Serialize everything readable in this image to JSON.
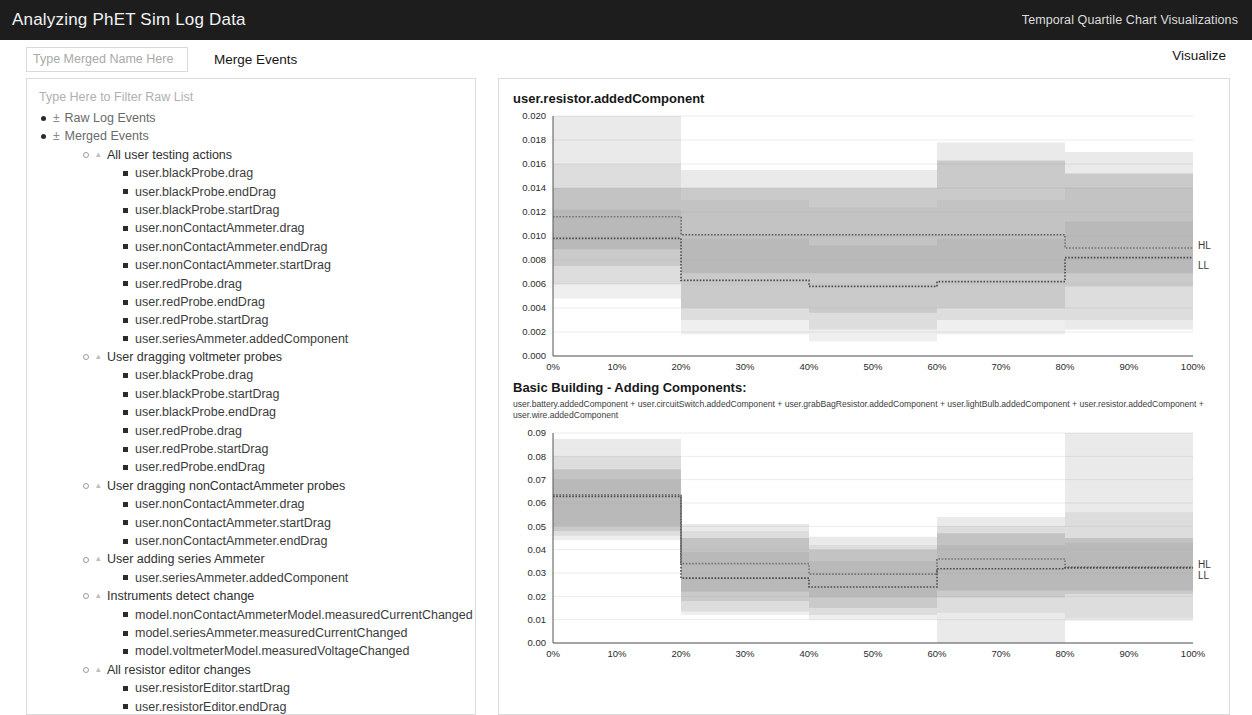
{
  "topbar": {
    "title": "Analyzing PhET Sim Log Data",
    "right_label": "Temporal Quartile Chart Visualizations"
  },
  "toolbar": {
    "merge_name_value": "",
    "merge_name_placeholder": "Type Merged Name Here",
    "merge_button": "Merge Events",
    "visualize_button": "Visualize"
  },
  "tree_panel": {
    "filter_value": "",
    "filter_placeholder": "Type Here to Filter Raw List",
    "toggle_symbol": "±",
    "nodes": [
      {
        "level": 0,
        "marker": "dot",
        "toggle": "±",
        "label": "Raw Log Events"
      },
      {
        "level": 0,
        "marker": "dot",
        "toggle": "±",
        "label": "Merged Events"
      },
      {
        "level": 1,
        "marker": "circle",
        "toggle": "",
        "label": "All user testing actions"
      },
      {
        "level": 2,
        "marker": "square",
        "toggle": "",
        "label": "user.blackProbe.drag"
      },
      {
        "level": 2,
        "marker": "square",
        "toggle": "",
        "label": "user.blackProbe.endDrag"
      },
      {
        "level": 2,
        "marker": "square",
        "toggle": "",
        "label": "user.blackProbe.startDrag"
      },
      {
        "level": 2,
        "marker": "square",
        "toggle": "",
        "label": "user.nonContactAmmeter.drag"
      },
      {
        "level": 2,
        "marker": "square",
        "toggle": "",
        "label": "user.nonContactAmmeter.endDrag"
      },
      {
        "level": 2,
        "marker": "square",
        "toggle": "",
        "label": "user.nonContactAmmeter.startDrag"
      },
      {
        "level": 2,
        "marker": "square",
        "toggle": "",
        "label": "user.redProbe.drag"
      },
      {
        "level": 2,
        "marker": "square",
        "toggle": "",
        "label": "user.redProbe.endDrag"
      },
      {
        "level": 2,
        "marker": "square",
        "toggle": "",
        "label": "user.redProbe.startDrag"
      },
      {
        "level": 2,
        "marker": "square",
        "toggle": "",
        "label": "user.seriesAmmeter.addedComponent"
      },
      {
        "level": 1,
        "marker": "circle",
        "toggle": "",
        "label": "User dragging voltmeter probes"
      },
      {
        "level": 2,
        "marker": "square",
        "toggle": "",
        "label": "user.blackProbe.drag"
      },
      {
        "level": 2,
        "marker": "square",
        "toggle": "",
        "label": "user.blackProbe.startDrag"
      },
      {
        "level": 2,
        "marker": "square",
        "toggle": "",
        "label": "user.blackProbe.endDrag"
      },
      {
        "level": 2,
        "marker": "square",
        "toggle": "",
        "label": "user.redProbe.drag"
      },
      {
        "level": 2,
        "marker": "square",
        "toggle": "",
        "label": "user.redProbe.startDrag"
      },
      {
        "level": 2,
        "marker": "square",
        "toggle": "",
        "label": "user.redProbe.endDrag"
      },
      {
        "level": 1,
        "marker": "circle",
        "toggle": "",
        "label": "User dragging nonContactAmmeter probes"
      },
      {
        "level": 2,
        "marker": "square",
        "toggle": "",
        "label": "user.nonContactAmmeter.drag"
      },
      {
        "level": 2,
        "marker": "square",
        "toggle": "",
        "label": "user.nonContactAmmeter.startDrag"
      },
      {
        "level": 2,
        "marker": "square",
        "toggle": "",
        "label": "user.nonContactAmmeter.endDrag"
      },
      {
        "level": 1,
        "marker": "circle",
        "toggle": "",
        "label": "User adding series Ammeter"
      },
      {
        "level": 2,
        "marker": "square",
        "toggle": "",
        "label": "user.seriesAmmeter.addedComponent"
      },
      {
        "level": 1,
        "marker": "circle",
        "toggle": "",
        "label": "Instruments detect change"
      },
      {
        "level": 2,
        "marker": "square",
        "toggle": "",
        "label": "model.nonContactAmmeterModel.measuredCurrentChanged"
      },
      {
        "level": 2,
        "marker": "square",
        "toggle": "",
        "label": "model.seriesAmmeter.measuredCurrentChanged"
      },
      {
        "level": 2,
        "marker": "square",
        "toggle": "",
        "label": "model.voltmeterModel.measuredVoltageChanged"
      },
      {
        "level": 1,
        "marker": "circle",
        "toggle": "",
        "label": "All resistor editor changes"
      },
      {
        "level": 2,
        "marker": "square",
        "toggle": "",
        "label": "user.resistorEditor.startDrag"
      },
      {
        "level": 2,
        "marker": "square",
        "toggle": "",
        "label": "user.resistorEditor.endDrag"
      }
    ]
  },
  "chart_data": [
    {
      "type": "area",
      "id": "chart-resistor-added-component",
      "title": "user.resistor.addedComponent",
      "subtitle": "",
      "xlabel": "",
      "ylabel": "",
      "xlim": [
        0,
        100
      ],
      "ylim": [
        0,
        0.02
      ],
      "grid": true,
      "legend_position": "right",
      "xticks": [
        "0%",
        "10%",
        "20%",
        "30%",
        "40%",
        "50%",
        "60%",
        "70%",
        "80%",
        "90%",
        "100%"
      ],
      "xtick_values": [
        0,
        10,
        20,
        30,
        40,
        50,
        60,
        70,
        80,
        90,
        100
      ],
      "yticks": [
        "0.000",
        "0.002",
        "0.004",
        "0.006",
        "0.008",
        "0.010",
        "0.012",
        "0.014",
        "0.016",
        "0.018",
        "0.020"
      ],
      "ytick_values": [
        0.0,
        0.002,
        0.004,
        0.006,
        0.008,
        0.01,
        0.012,
        0.014,
        0.016,
        0.018,
        0.02
      ],
      "bin_edges": [
        0,
        20,
        40,
        60,
        80,
        100
      ],
      "series": [
        {
          "name": "HL",
          "label": "HL",
          "color": "#8c8c8c",
          "median_values": [
            0.0116,
            0.0101,
            0.0101,
            0.0101,
            0.009
          ],
          "q1_values": [
            0.0089,
            0.0069,
            0.0069,
            0.0069,
            0.0069
          ],
          "q3_values": [
            0.014,
            0.014,
            0.014,
            0.0163,
            0.0152
          ],
          "outer_low_values": [
            0.006,
            0.003,
            0.0022,
            0.003,
            0.0022
          ],
          "outer_high_values": [
            0.02,
            0.0155,
            0.0155,
            0.0178,
            0.017
          ]
        },
        {
          "name": "LL",
          "label": "LL",
          "color": "#a8a8a8",
          "median_values": [
            0.0098,
            0.0063,
            0.0058,
            0.0062,
            0.0082
          ],
          "q1_values": [
            0.0075,
            0.004,
            0.0036,
            0.004,
            0.0058
          ],
          "q3_values": [
            0.0122,
            0.0098,
            0.0092,
            0.0098,
            0.0112
          ],
          "outer_low_values": [
            0.0048,
            0.0018,
            0.0012,
            0.0018,
            0.003
          ],
          "outer_high_values": [
            0.016,
            0.013,
            0.0124,
            0.013,
            0.014
          ]
        }
      ]
    },
    {
      "type": "area",
      "id": "chart-basic-building-adding-components",
      "title": "Basic Building - Adding Components:",
      "subtitle": "user.battery.addedComponent + user.circuitSwitch.addedComponent + user.grabBagResistor.addedComponent + user.lightBulb.addedComponent + user.resistor.addedComponent + user.wire.addedComponent",
      "xlabel": "",
      "ylabel": "",
      "xlim": [
        0,
        100
      ],
      "ylim": [
        0,
        0.09
      ],
      "grid": true,
      "legend_position": "right",
      "xticks": [
        "0%",
        "10%",
        "20%",
        "30%",
        "40%",
        "50%",
        "60%",
        "70%",
        "80%",
        "90%",
        "100%"
      ],
      "xtick_values": [
        0,
        10,
        20,
        30,
        40,
        50,
        60,
        70,
        80,
        90,
        100
      ],
      "yticks": [
        "0.00",
        "0.01",
        "0.02",
        "0.03",
        "0.04",
        "0.05",
        "0.06",
        "0.07",
        "0.08",
        "0.09"
      ],
      "ytick_values": [
        0.0,
        0.01,
        0.02,
        0.03,
        0.04,
        0.05,
        0.06,
        0.07,
        0.08,
        0.09
      ],
      "bin_edges": [
        0,
        20,
        40,
        60,
        80,
        100
      ],
      "series": [
        {
          "name": "HL",
          "label": "HL",
          "color": "#8c8c8c",
          "median_values": [
            0.0635,
            0.034,
            0.0295,
            0.036,
            0.0325
          ],
          "q1_values": [
            0.05,
            0.022,
            0.0195,
            0.0225,
            0.0225
          ],
          "q3_values": [
            0.0745,
            0.045,
            0.04,
            0.047,
            0.045
          ],
          "outer_low_values": [
            0.046,
            0.0135,
            0.012,
            0.0,
            0.0105
          ],
          "outer_high_values": [
            0.0875,
            0.051,
            0.0455,
            0.054,
            0.09
          ]
        },
        {
          "name": "LL",
          "label": "LL",
          "color": "#a8a8a8",
          "median_values": [
            0.0628,
            0.0278,
            0.024,
            0.0318,
            0.0322
          ],
          "q1_values": [
            0.048,
            0.018,
            0.015,
            0.0195,
            0.021
          ],
          "q3_values": [
            0.07,
            0.039,
            0.035,
            0.042,
            0.043
          ],
          "outer_low_values": [
            0.044,
            0.012,
            0.01,
            0.013,
            0.0095
          ],
          "outer_high_values": [
            0.08,
            0.048,
            0.042,
            0.05,
            0.056
          ]
        }
      ]
    }
  ]
}
